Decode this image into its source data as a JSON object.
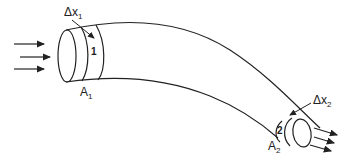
{
  "diagram": {
    "type": "fluid-flow-continuity",
    "section1": {
      "label": "1",
      "delta_label": "Δx",
      "delta_sub": "1",
      "area_label": "A",
      "area_sub": "1"
    },
    "section2": {
      "label": "2",
      "delta_label": "Δx",
      "delta_sub": "2",
      "area_label": "A",
      "area_sub": "2"
    },
    "inflow_arrows": 3,
    "outflow_arrows": 3,
    "stroke_color": "#222222"
  }
}
